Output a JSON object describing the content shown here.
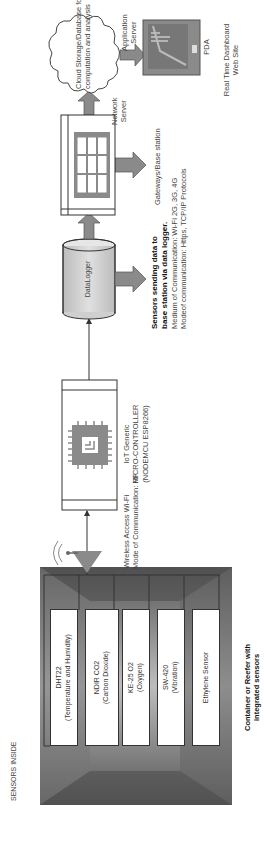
{
  "container": {
    "header": "SENSORS INSIDE",
    "caption_line1": "Container or Reefer with",
    "caption_line2": "integrated sensors",
    "sensors": [
      {
        "name": "DHT22",
        "detail": "(Temperature and Humidity)"
      },
      {
        "name": "NDIR CO2",
        "detail": "(Carbon Dioxide)"
      },
      {
        "name": "KE-25 O2",
        "detail": "(Oxygen)"
      },
      {
        "name": "SW-420",
        "detail": "(Vibration)"
      },
      {
        "name": "Ethylene Sensor",
        "detail": ""
      },
      {
        "name": "NEO 6M V2",
        "detail": "(GPS)"
      }
    ]
  },
  "wireless": {
    "line1": "Wireless Access Wi-Fi",
    "line2": "Mode of Communication: RF"
  },
  "microcontroller": {
    "line1": "IoT Generic",
    "line2": "MICRO-CONTROLLER",
    "line3": "(NODEMCU ESP8266)"
  },
  "datalogger": {
    "label": "DataLogger",
    "caption_bold1": "Sensors sending data to",
    "caption_bold2": "base station via data logger.",
    "caption_line3": "Medium of Communication: Wi-Fi 2G, 3G, 4G",
    "caption_line4": "Modeof communication: Https, TCP/IP Protocols"
  },
  "gateway": {
    "label": "Gateways/Base station"
  },
  "network_server": {
    "line1": "Network",
    "line2": "Server"
  },
  "cloud": {
    "line1": "Cloud Storage/Database for",
    "line2": "computation and analysis"
  },
  "application_server": {
    "line1": "Application",
    "line2": "Server"
  },
  "pda": {
    "label": "PDA",
    "caption_line1": "Real Time Dashboard",
    "caption_line2": "Web Site"
  },
  "colors": {
    "arrow_fill": "#8a8a8a",
    "container_dark": "#5a5a5a",
    "container_light": "#c8c8c8",
    "cylinder_fill": "#cfcfcf",
    "line": "#333333"
  }
}
